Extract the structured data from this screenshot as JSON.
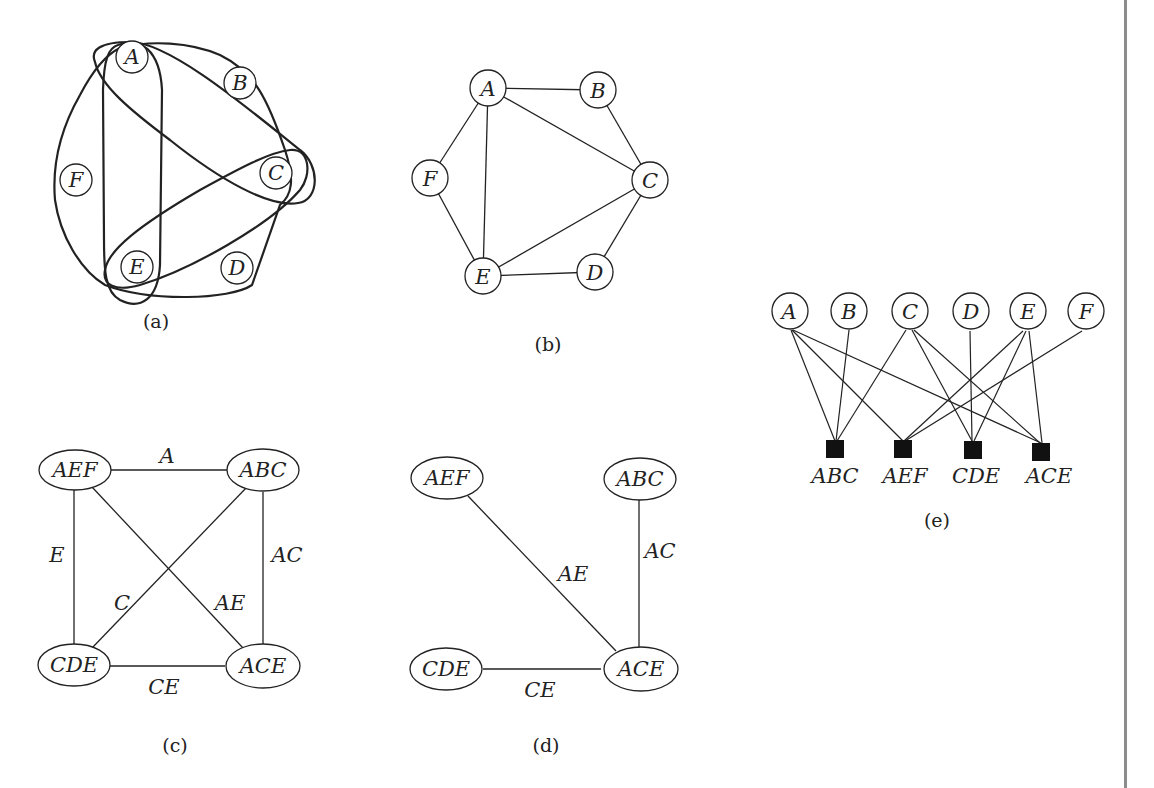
{
  "figure": {
    "panels": [
      {
        "id": "a",
        "caption": "(a)",
        "kind": "hypergraph",
        "nodes": [
          {
            "label": "A",
            "x": 132,
            "y": 57
          },
          {
            "label": "B",
            "x": 240,
            "y": 83
          },
          {
            "label": "C",
            "x": 276,
            "y": 173
          },
          {
            "label": "D",
            "x": 237,
            "y": 268
          },
          {
            "label": "E",
            "x": 137,
            "y": 267
          },
          {
            "label": "F",
            "x": 76,
            "y": 180
          }
        ],
        "hyperedges": [
          "ABC",
          "AEF",
          "CDE",
          "ACE"
        ]
      },
      {
        "id": "b",
        "caption": "(b)",
        "kind": "primal-graph",
        "nodes": [
          {
            "label": "A",
            "x": 488,
            "y": 88
          },
          {
            "label": "B",
            "x": 598,
            "y": 90
          },
          {
            "label": "C",
            "x": 650,
            "y": 180
          },
          {
            "label": "D",
            "x": 595,
            "y": 272
          },
          {
            "label": "E",
            "x": 483,
            "y": 276
          },
          {
            "label": "F",
            "x": 430,
            "y": 178
          }
        ],
        "edges": [
          [
            "A",
            "B"
          ],
          [
            "A",
            "C"
          ],
          [
            "A",
            "E"
          ],
          [
            "A",
            "F"
          ],
          [
            "B",
            "C"
          ],
          [
            "C",
            "E"
          ],
          [
            "C",
            "D"
          ],
          [
            "D",
            "E"
          ],
          [
            "E",
            "F"
          ]
        ]
      },
      {
        "id": "c",
        "caption": "(c)",
        "kind": "dual-graph",
        "nodes": [
          {
            "label": "AEF",
            "x": 62,
            "y": 468
          },
          {
            "label": "ABC",
            "x": 260,
            "y": 468
          },
          {
            "label": "CDE",
            "x": 46,
            "y": 665
          },
          {
            "label": "ACE",
            "x": 263,
            "y": 665
          }
        ],
        "edges": [
          {
            "from": "AEF",
            "to": "ABC",
            "label": "A"
          },
          {
            "from": "AEF",
            "to": "CDE",
            "label": "E"
          },
          {
            "from": "ABC",
            "to": "ACE",
            "label": "AC"
          },
          {
            "from": "ABC",
            "to": "CDE",
            "label": "C"
          },
          {
            "from": "AEF",
            "to": "ACE",
            "label": "AE"
          },
          {
            "from": "CDE",
            "to": "ACE",
            "label": "CE"
          }
        ]
      },
      {
        "id": "d",
        "caption": "(d)",
        "kind": "join-tree",
        "nodes": [
          {
            "label": "AEF",
            "x": 448,
            "y": 477
          },
          {
            "label": "ABC",
            "x": 640,
            "y": 478
          },
          {
            "label": "CDE",
            "x": 446,
            "y": 667
          },
          {
            "label": "ACE",
            "x": 644,
            "y": 667
          }
        ],
        "edges": [
          {
            "from": "AEF",
            "to": "ACE",
            "label": "AE"
          },
          {
            "from": "ABC",
            "to": "ACE",
            "label": "AC"
          },
          {
            "from": "CDE",
            "to": "ACE",
            "label": "CE"
          }
        ]
      },
      {
        "id": "e",
        "caption": "(e)",
        "kind": "factor-graph",
        "variables": [
          {
            "label": "A",
            "x": 816,
            "y": 313
          },
          {
            "label": "B",
            "x": 849,
            "y": 313
          },
          {
            "label": "C",
            "x": 908,
            "y": 313
          },
          {
            "label": "D",
            "x": 970,
            "y": 313
          },
          {
            "label": "E",
            "x": 1026,
            "y": 313
          },
          {
            "label": "F",
            "x": 1083,
            "y": 313
          }
        ],
        "factors": [
          {
            "label": "ABC",
            "x": 835,
            "y": 450
          },
          {
            "label": "AEF",
            "x": 903,
            "y": 450
          },
          {
            "label": "CDE",
            "x": 973,
            "y": 450
          },
          {
            "label": "ACE",
            "x": 1041,
            "y": 452
          }
        ],
        "edges": [
          [
            "A",
            "ABC"
          ],
          [
            "A",
            "AEF"
          ],
          [
            "A",
            "ACE"
          ],
          [
            "B",
            "ABC"
          ],
          [
            "C",
            "ABC"
          ],
          [
            "C",
            "CDE"
          ],
          [
            "C",
            "ACE"
          ],
          [
            "D",
            "CDE"
          ],
          [
            "E",
            "AEF"
          ],
          [
            "E",
            "CDE"
          ],
          [
            "E",
            "ACE"
          ],
          [
            "F",
            "AEF"
          ]
        ]
      }
    ],
    "captions": {
      "a": "(a)",
      "b": "(b)",
      "c": "(c)",
      "d": "(d)",
      "e": "(e)"
    },
    "colors": {
      "ink": "#222222",
      "background": "#ffffff",
      "page_edge": "#8c8c8c"
    }
  }
}
